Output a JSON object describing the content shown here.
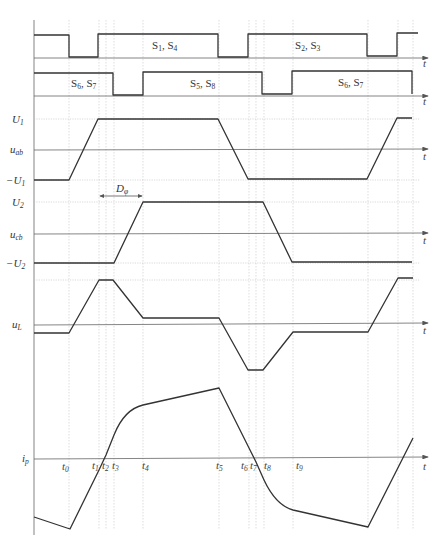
{
  "figure": {
    "type": "timing-diagram",
    "axis_label": "t",
    "time_markers": [
      {
        "id": "t0",
        "label": "t",
        "sub": "0",
        "x": 69
      },
      {
        "id": "t1",
        "label": "t",
        "sub": "1",
        "x": 99
      },
      {
        "id": "t2",
        "label": "t",
        "sub": "2",
        "x": 106
      },
      {
        "id": "t3",
        "label": "t",
        "sub": "3",
        "x": 114
      },
      {
        "id": "t4",
        "label": "t",
        "sub": "4",
        "x": 143
      },
      {
        "id": "t5",
        "label": "t",
        "sub": "5",
        "x": 219
      },
      {
        "id": "t6",
        "label": "t",
        "sub": "6",
        "x": 249
      },
      {
        "id": "t7",
        "label": "t",
        "sub": "7",
        "x": 256
      },
      {
        "id": "t8",
        "label": "t",
        "sub": "8",
        "x": 264
      },
      {
        "id": "t9",
        "label": "t",
        "sub": "9",
        "x": 293
      }
    ],
    "gate_signals": [
      {
        "row": 1,
        "labels": [
          {
            "text": "S",
            "sub1": "1",
            "sep": ", S",
            "sub2": "4"
          },
          {
            "text": "S",
            "sub1": "2",
            "sep": ", S",
            "sub2": "3"
          }
        ]
      },
      {
        "row": 2,
        "labels": [
          {
            "text": "S",
            "sub1": "6",
            "sep": ", S",
            "sub2": "7"
          },
          {
            "text": "S",
            "sub1": "5",
            "sep": ", S",
            "sub2": "8"
          },
          {
            "text": "S",
            "sub1": "6",
            "sep": ", S",
            "sub2": "7"
          }
        ]
      }
    ],
    "waveforms": {
      "uab": {
        "name": "u",
        "sub": "ab",
        "high": "U",
        "high_sub": "1",
        "low": "−U",
        "low_sub": "1"
      },
      "ucb": {
        "name": "u",
        "sub": "cb",
        "high": "U",
        "high_sub": "2",
        "low": "−U",
        "low_sub": "2"
      },
      "uL": {
        "name": "u",
        "sub": "L"
      },
      "ip": {
        "name": "i",
        "sub": "p"
      }
    },
    "phase_shift": {
      "label": "D",
      "sub": "φ"
    }
  }
}
